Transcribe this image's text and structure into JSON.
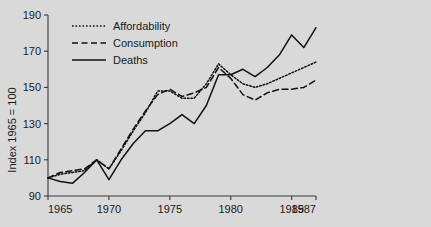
{
  "chart_data": {
    "type": "line",
    "title": "",
    "subtitle": "",
    "xlabel": "",
    "ylabel": "Index 1965 = 100",
    "xlim": [
      1965,
      1987
    ],
    "ylim": [
      90,
      190
    ],
    "grid": false,
    "legend_position": "top-left",
    "x_ticks": [
      1965,
      1970,
      1975,
      1980,
      1985,
      1987
    ],
    "x_tick_labels": [
      "1965",
      "1970",
      "1975",
      "1980",
      "1985",
      "1987"
    ],
    "y_ticks": [
      90,
      110,
      130,
      150,
      170,
      190
    ],
    "y_tick_labels": [
      "90",
      "110",
      "130",
      "150",
      "170",
      "190"
    ],
    "x": [
      1965,
      1966,
      1967,
      1968,
      1969,
      1970,
      1971,
      1972,
      1973,
      1974,
      1975,
      1976,
      1977,
      1978,
      1979,
      1980,
      1981,
      1982,
      1983,
      1984,
      1985,
      1986,
      1987
    ],
    "series": [
      {
        "name": "Affordability",
        "style": "dotted",
        "values": [
          100,
          102,
          103,
          104,
          110,
          105,
          115,
          126,
          136,
          148,
          148,
          144,
          144,
          152,
          163,
          157,
          152,
          150,
          152,
          155,
          158,
          161,
          164
        ]
      },
      {
        "name": "Consumption",
        "style": "dashed",
        "values": [
          100,
          103,
          104,
          105,
          110,
          105,
          116,
          127,
          137,
          146,
          149,
          145,
          147,
          150,
          161,
          155,
          146,
          143,
          147,
          149,
          149,
          150,
          154
        ]
      },
      {
        "name": "Deaths",
        "style": "solid",
        "values": [
          100,
          98,
          97,
          103,
          110,
          99,
          110,
          119,
          126,
          126,
          130,
          135,
          130,
          140,
          157,
          157,
          160,
          156,
          161,
          168,
          179,
          172,
          183
        ]
      }
    ]
  },
  "axes": {
    "y_axis_title": "Index 1965 = 100"
  },
  "legend": {
    "items": [
      {
        "label": "Affordability",
        "style": "dotted"
      },
      {
        "label": "Consumption",
        "style": "dashed"
      },
      {
        "label": "Deaths",
        "style": "solid"
      }
    ]
  },
  "colors": {
    "background": "#d9d9d9",
    "ink": "#111111",
    "axis": "#3a3a3a"
  }
}
